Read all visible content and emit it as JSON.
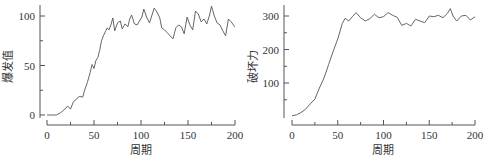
{
  "chart_data": [
    {
      "type": "line",
      "title": "",
      "xlabel": "周期",
      "ylabel": "爆发值",
      "xlim": [
        0,
        200
      ],
      "ylim": [
        0,
        110
      ],
      "xticks": [
        0,
        50,
        100,
        150,
        200
      ],
      "xtick_labels": [
        "0",
        "50",
        "100",
        "150",
        "200"
      ],
      "yticks": [
        0,
        50,
        100
      ],
      "ytick_labels": [
        "0",
        "50",
        "100"
      ],
      "grid": false,
      "series": [
        {
          "name": "爆发值",
          "x": [
            0,
            5,
            10,
            14,
            18,
            22,
            25,
            28,
            32,
            35,
            38,
            40,
            43,
            46,
            48,
            50,
            52,
            54,
            56,
            58,
            60,
            62,
            64,
            66,
            68,
            70,
            72,
            75,
            78,
            80,
            83,
            86,
            88,
            90,
            93,
            96,
            99,
            101,
            103,
            106,
            109,
            112,
            114,
            117,
            120,
            122,
            125,
            128,
            131,
            134,
            137,
            140,
            143,
            146,
            149,
            152,
            155,
            158,
            161,
            164,
            167,
            170,
            173,
            175,
            178,
            181,
            184,
            187,
            190,
            193,
            196,
            199,
            200
          ],
          "values": [
            0,
            0,
            0,
            2,
            5,
            9,
            6,
            13,
            17,
            19,
            18,
            25,
            33,
            43,
            51,
            47,
            55,
            58,
            65,
            75,
            80,
            84,
            88,
            86,
            91,
            98,
            85,
            93,
            95,
            87,
            92,
            89,
            97,
            101,
            92,
            91,
            96,
            99,
            107,
            99,
            93,
            102,
            108,
            104,
            98,
            88,
            86,
            83,
            80,
            77,
            88,
            91,
            89,
            82,
            99,
            91,
            86,
            105,
            102,
            94,
            97,
            92,
            101,
            110,
            100,
            93,
            91,
            85,
            80,
            97,
            94,
            90,
            89
          ]
        }
      ]
    },
    {
      "type": "line",
      "title": "",
      "xlabel": "周期",
      "ylabel": "破坏力",
      "xlim": [
        0,
        200
      ],
      "ylim": [
        0,
        330
      ],
      "xticks": [
        0,
        50,
        100,
        150,
        200
      ],
      "xtick_labels": [
        "0",
        "50",
        "100",
        "150",
        "200"
      ],
      "yticks": [
        100,
        200,
        300
      ],
      "ytick_labels": [
        "100",
        "200",
        "300"
      ],
      "grid": false,
      "series": [
        {
          "name": "破坏力",
          "x": [
            0,
            5,
            10,
            15,
            20,
            25,
            30,
            35,
            40,
            45,
            50,
            55,
            58,
            62,
            66,
            70,
            75,
            80,
            85,
            90,
            95,
            100,
            105,
            110,
            115,
            120,
            125,
            130,
            135,
            140,
            145,
            150,
            155,
            160,
            165,
            170,
            173,
            176,
            180,
            185,
            190,
            195,
            200
          ],
          "values": [
            2,
            5,
            12,
            22,
            38,
            52,
            85,
            115,
            155,
            195,
            232,
            278,
            293,
            285,
            298,
            310,
            295,
            285,
            292,
            305,
            295,
            298,
            310,
            302,
            296,
            272,
            278,
            270,
            290,
            285,
            280,
            300,
            298,
            302,
            295,
            308,
            322,
            300,
            285,
            300,
            302,
            288,
            298
          ]
        }
      ]
    }
  ],
  "labels": {
    "left_ylabel": "爆发值",
    "right_ylabel": "破坏力",
    "xlabel": "周期"
  }
}
